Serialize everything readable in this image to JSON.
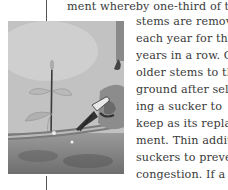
{
  "document": {
    "first_line": "ment whereby one-third of the old",
    "wrapped_lines": [
      "stems are removed",
      "each year for three",
      "years in a row. Cut",
      "older stems to the",
      "ground after select",
      "ing a sucker to",
      "keep as its replace-",
      "ment. Thin addition",
      "suckers to prevent",
      "congestion. If a shr"
    ]
  }
}
